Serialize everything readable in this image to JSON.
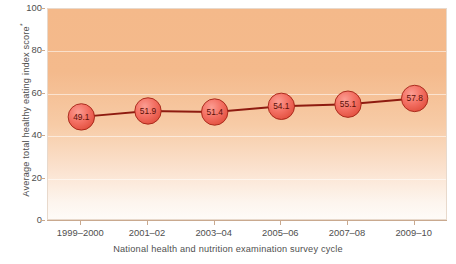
{
  "chart_data": {
    "type": "line",
    "title": "",
    "categories": [
      "1999–2000",
      "2001–02",
      "2003–04",
      "2005–06",
      "2007–08",
      "2009–10"
    ],
    "values": [
      49.1,
      51.9,
      51.4,
      54.1,
      55.1,
      57.8
    ],
    "data_labels": [
      "49.1",
      "51.9",
      "51.4",
      "54.1",
      "55.1",
      "57.8"
    ],
    "xlabel": "National health and nutrition examination survey cycle",
    "ylabel": "Average total healthy eating index score",
    "ylabel_superscript": "*",
    "ylim": [
      0,
      100
    ],
    "yticks": [
      0,
      20,
      40,
      60,
      80,
      100
    ],
    "ytick_labels": [
      "0",
      "20",
      "40",
      "60",
      "80",
      "100"
    ],
    "grid": true,
    "legend": "none",
    "series": [
      {
        "name": "Average total healthy eating index score",
        "values": [
          49.1,
          51.9,
          51.4,
          54.1,
          55.1,
          57.8
        ]
      }
    ],
    "colors": {
      "line": "#8e1b10",
      "marker_fill": "#f0685c",
      "marker_stroke": "#a32215",
      "marker_label": "#5a1008",
      "plot_bg_top": "#f4b98a",
      "plot_bg_bottom": "#fefbf8",
      "plot_border": "#e8d9cc",
      "axis": "#c9a98f",
      "text": "#4f4f4f",
      "page_bg": "#ffffff"
    }
  }
}
